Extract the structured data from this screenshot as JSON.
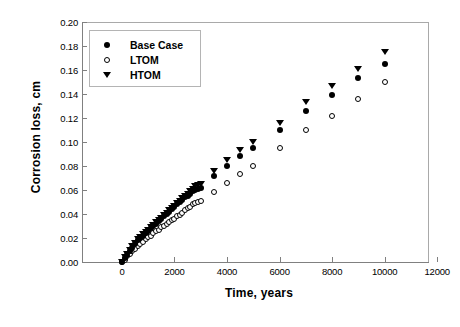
{
  "chart_data": {
    "type": "scatter",
    "title": "",
    "xlabel": "Time, years",
    "ylabel": "Corrosion loss, cm",
    "xlim": [
      -1520,
      11650
    ],
    "ylim": [
      0.0,
      0.2
    ],
    "xticks": [
      0,
      2000,
      4000,
      6000,
      8000,
      10000,
      12000
    ],
    "xticklabels": [
      "0",
      "2000",
      "4000",
      "6000",
      "8000",
      "10000",
      "12000"
    ],
    "yticks": [
      0.0,
      0.02,
      0.04,
      0.06,
      0.08,
      0.1,
      0.12,
      0.14,
      0.16,
      0.18,
      0.2
    ],
    "yticklabels": [
      "0.00",
      "0.02",
      "0.04",
      "0.06",
      "0.08",
      "0.10",
      "0.12",
      "0.14",
      "0.16",
      "0.18",
      "0.20"
    ],
    "grid": false,
    "legend_position": "upper left",
    "series": [
      {
        "name": "Base Case",
        "marker": "filled-circle",
        "color": "#000000",
        "x": [
          0,
          100,
          200,
          300,
          400,
          500,
          600,
          700,
          800,
          900,
          1000,
          1100,
          1200,
          1300,
          1400,
          1500,
          1600,
          1700,
          1800,
          1900,
          2000,
          2100,
          2200,
          2300,
          2400,
          2500,
          2600,
          2700,
          2800,
          2900,
          3000,
          3500,
          4000,
          4500,
          5000,
          6000,
          7000,
          8000,
          9000,
          10000
        ],
        "y": [
          0.0,
          0.003,
          0.006,
          0.009,
          0.012,
          0.015,
          0.018,
          0.02,
          0.022,
          0.024,
          0.026,
          0.028,
          0.03,
          0.032,
          0.034,
          0.036,
          0.038,
          0.04,
          0.042,
          0.044,
          0.046,
          0.048,
          0.05,
          0.052,
          0.054,
          0.055,
          0.057,
          0.059,
          0.06,
          0.061,
          0.062,
          0.072,
          0.08,
          0.088,
          0.095,
          0.11,
          0.126,
          0.139,
          0.153,
          0.165
        ]
      },
      {
        "name": "LTOM",
        "marker": "open-circle",
        "color": "#000000",
        "x": [
          0,
          100,
          200,
          300,
          400,
          500,
          600,
          700,
          800,
          900,
          1000,
          1100,
          1200,
          1300,
          1400,
          1500,
          1600,
          1700,
          1800,
          1900,
          2000,
          2100,
          2200,
          2300,
          2400,
          2500,
          2600,
          2700,
          2800,
          2900,
          3000,
          3500,
          4000,
          4500,
          5000,
          6000,
          7000,
          8000,
          9000,
          10000
        ],
        "y": [
          0.0,
          0.002,
          0.005,
          0.007,
          0.009,
          0.011,
          0.013,
          0.015,
          0.017,
          0.019,
          0.021,
          0.022,
          0.024,
          0.026,
          0.027,
          0.029,
          0.03,
          0.032,
          0.033,
          0.035,
          0.036,
          0.038,
          0.039,
          0.041,
          0.043,
          0.045,
          0.046,
          0.048,
          0.049,
          0.05,
          0.051,
          0.058,
          0.066,
          0.073,
          0.08,
          0.095,
          0.11,
          0.122,
          0.136,
          0.15
        ]
      },
      {
        "name": "HTOM",
        "marker": "filled-triangle-down",
        "color": "#000000",
        "x": [
          0,
          100,
          200,
          300,
          400,
          500,
          600,
          700,
          800,
          900,
          1000,
          1100,
          1200,
          1300,
          1400,
          1500,
          1600,
          1700,
          1800,
          1900,
          2000,
          2100,
          2200,
          2300,
          2400,
          2500,
          2600,
          2700,
          2800,
          2900,
          3000,
          3500,
          4000,
          4500,
          5000,
          6000,
          7000,
          8000,
          9000,
          10000
        ],
        "y": [
          0.0,
          0.004,
          0.007,
          0.01,
          0.013,
          0.016,
          0.019,
          0.021,
          0.023,
          0.025,
          0.027,
          0.029,
          0.031,
          0.033,
          0.035,
          0.037,
          0.039,
          0.041,
          0.043,
          0.045,
          0.047,
          0.049,
          0.051,
          0.053,
          0.055,
          0.057,
          0.059,
          0.061,
          0.063,
          0.064,
          0.065,
          0.076,
          0.085,
          0.093,
          0.1,
          0.116,
          0.133,
          0.147,
          0.161,
          0.175
        ]
      }
    ]
  },
  "legend": {
    "entries": [
      {
        "label": "Base Case",
        "marker": "filled-circle"
      },
      {
        "label": "LTOM",
        "marker": "open-circle"
      },
      {
        "label": "HTOM",
        "marker": "filled-triangle-down"
      }
    ]
  }
}
